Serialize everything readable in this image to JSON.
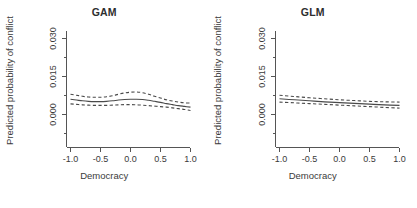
{
  "figure": {
    "background": "#ffffff",
    "line_color": "#4a4a4a",
    "axis_color": "#555555",
    "panel_count": 2
  },
  "panels": [
    {
      "key": "gam",
      "title": "GAM",
      "xlabel": "Democracy",
      "ylabel": "Predicted probability of conflict"
    },
    {
      "key": "glm",
      "title": "GLM",
      "xlabel": "Democracy",
      "ylabel": "Predicted probability of conflict"
    }
  ],
  "axes": {
    "ytick_labels": [
      "0.000",
      "0.015",
      "0.030"
    ],
    "ytick_values": [
      0.0,
      0.015,
      0.03
    ],
    "xtick_labels": [
      "-1.0",
      "-0.5",
      "0.0",
      "0.5",
      "1.0"
    ],
    "xtick_values": [
      -1.0,
      -0.5,
      0.0,
      0.5,
      1.0
    ],
    "xlim": [
      -1.05,
      1.05
    ],
    "ylim": [
      -0.002,
      0.0335
    ],
    "grid": false
  },
  "chart_data": [
    {
      "type": "line",
      "title": "GAM",
      "xlabel": "Democracy",
      "ylabel": "Predicted probability of conflict",
      "xlim": [
        -1.05,
        1.05
      ],
      "ylim": [
        -0.002,
        0.0335
      ],
      "xticks": [
        -1.0,
        -0.5,
        0.0,
        0.5,
        1.0
      ],
      "yticks": [
        0.0,
        0.015,
        0.03
      ],
      "grid": false,
      "legend": "none",
      "x": [
        -1.0,
        -0.9,
        -0.8,
        -0.7,
        -0.6,
        -0.5,
        -0.4,
        -0.3,
        -0.2,
        -0.1,
        0.0,
        0.1,
        0.2,
        0.3,
        0.4,
        0.5,
        0.6,
        0.7,
        0.8,
        0.9,
        1.0
      ],
      "series": [
        {
          "name": "fit",
          "style": "solid",
          "values": [
            0.006,
            0.0057,
            0.0054,
            0.0052,
            0.0051,
            0.0051,
            0.0052,
            0.0054,
            0.0057,
            0.0059,
            0.006,
            0.006,
            0.0059,
            0.0056,
            0.0052,
            0.0048,
            0.0043,
            0.0039,
            0.0035,
            0.0032,
            0.0029
          ]
        },
        {
          "name": "upper_ci",
          "style": "dashed",
          "values": [
            0.008,
            0.0076,
            0.0072,
            0.0069,
            0.0068,
            0.0068,
            0.007,
            0.0074,
            0.008,
            0.0085,
            0.0088,
            0.0089,
            0.0086,
            0.008,
            0.0072,
            0.0065,
            0.0058,
            0.0053,
            0.0049,
            0.0046,
            0.0045
          ]
        },
        {
          "name": "lower_ci",
          "style": "dashed",
          "values": [
            0.0042,
            0.004,
            0.0038,
            0.0037,
            0.0036,
            0.0036,
            0.0036,
            0.0037,
            0.0038,
            0.0039,
            0.0039,
            0.0038,
            0.0037,
            0.0035,
            0.0033,
            0.0031,
            0.0029,
            0.0026,
            0.0023,
            0.002,
            0.0016
          ]
        }
      ]
    },
    {
      "type": "line",
      "title": "GLM",
      "xlabel": "Democracy",
      "ylabel": "Predicted probability of conflict",
      "xlim": [
        -1.05,
        1.05
      ],
      "ylim": [
        -0.002,
        0.0335
      ],
      "xticks": [
        -1.0,
        -0.5,
        0.0,
        0.5,
        1.0
      ],
      "yticks": [
        0.0,
        0.015,
        0.03
      ],
      "grid": false,
      "legend": "none",
      "x": [
        -1.0,
        -0.75,
        -0.5,
        -0.25,
        0.0,
        0.25,
        0.5,
        0.75,
        1.0
      ],
      "series": [
        {
          "name": "fit",
          "style": "solid",
          "values": [
            0.0062,
            0.0058,
            0.0054,
            0.005,
            0.0047,
            0.0044,
            0.0041,
            0.0038,
            0.0036
          ]
        },
        {
          "name": "upper_ci",
          "style": "dashed",
          "values": [
            0.0076,
            0.0071,
            0.0066,
            0.0062,
            0.0058,
            0.0055,
            0.0052,
            0.005,
            0.0049
          ]
        },
        {
          "name": "lower_ci",
          "style": "dashed",
          "values": [
            0.0049,
            0.0046,
            0.0043,
            0.004,
            0.0037,
            0.0034,
            0.0031,
            0.0028,
            0.0025
          ]
        }
      ]
    }
  ]
}
